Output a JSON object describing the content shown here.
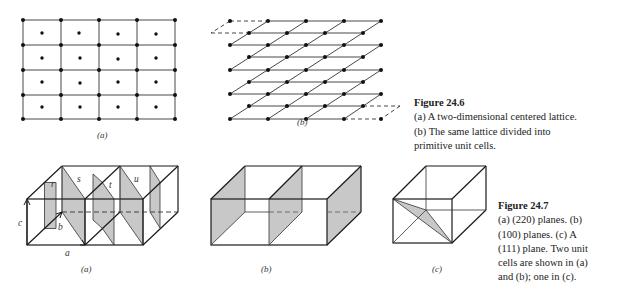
{
  "figure_24_6": {
    "title": "Figure 24.6",
    "lines": [
      "(a) A two-dimensional centered lattice.",
      "(b) The same lattice divided into",
      "primitive unit cells."
    ],
    "panel_labels": {
      "a": "(a)",
      "b": "(b)"
    }
  },
  "figure_24_7": {
    "title": "Figure 24.7",
    "lines": [
      "(a) (220) planes. (b)",
      "(100) planes. (c) A",
      "(111) plane. Two unit",
      "cells are shown in (a)",
      "and (b); one in (c)."
    ],
    "panel_labels": {
      "a": "(a)",
      "b": "(b)",
      "c": "(c)"
    },
    "plane_labels": {
      "r": "r",
      "s": "s",
      "t": "t",
      "u": "u"
    },
    "axis_labels": {
      "a": "a",
      "b": "b",
      "c": "c"
    }
  },
  "colors": {
    "line": "#1a1a1a",
    "shade": "#c8c8c8",
    "background": "#ffffff"
  }
}
